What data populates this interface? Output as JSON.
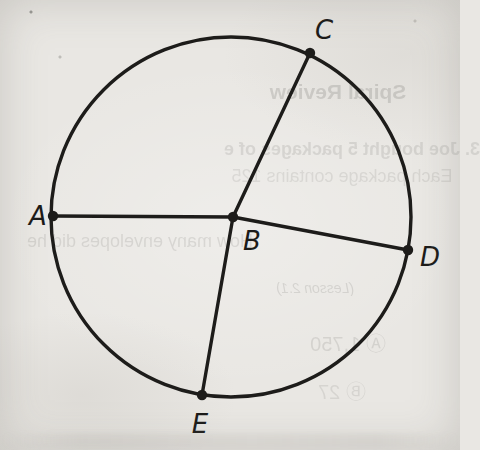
{
  "figure": {
    "type": "circle-with-radii",
    "circle": {
      "cx": 231,
      "cy": 217,
      "r": 180
    },
    "stroke_color": "#1d1c1a",
    "stroke_width": 3.4,
    "dot_radius": 5.2,
    "center_point": "B",
    "points": {
      "A": {
        "x": 53,
        "y": 216,
        "lx": 38,
        "ly": 216
      },
      "B": {
        "x": 233,
        "y": 217,
        "lx": 252,
        "ly": 241
      },
      "C": {
        "x": 310,
        "y": 53,
        "lx": 324,
        "ly": 30
      },
      "D": {
        "x": 408,
        "y": 250,
        "lx": 430,
        "ly": 257
      },
      "E": {
        "x": 202,
        "y": 395,
        "lx": 200,
        "ly": 424
      }
    },
    "segments": [
      [
        "A",
        "B"
      ],
      [
        "B",
        "C"
      ],
      [
        "B",
        "D"
      ],
      [
        "B",
        "E"
      ]
    ]
  },
  "bleed_through_text": {
    "color": "#5f5e5a",
    "lines": [
      {
        "text": "Spiral Review",
        "cx": 338,
        "cy": 92,
        "size": 21,
        "weight": "bold",
        "style": "normal",
        "opacity": 0.2
      },
      {
        "text": "3. Joe bought 5 packages of e",
        "cx": 352,
        "cy": 149,
        "size": 18,
        "weight": "bold",
        "style": "normal",
        "opacity": 0.15
      },
      {
        "text": "Each package contains 125",
        "cx": 342,
        "cy": 176,
        "size": 18,
        "weight": "normal",
        "style": "normal",
        "opacity": 0.13
      },
      {
        "text": "How many envelopes did he",
        "cx": 140,
        "cy": 241,
        "size": 18,
        "weight": "normal",
        "style": "normal",
        "opacity": 0.15
      },
      {
        "text": "(Lesson 2.1)",
        "cx": 315,
        "cy": 288,
        "size": 14,
        "weight": "normal",
        "style": "italic",
        "opacity": 0.16
      },
      {
        "text": "Ⓐ 1,750",
        "cx": 348,
        "cy": 342,
        "size": 20,
        "weight": "normal",
        "style": "normal",
        "opacity": 0.15
      },
      {
        "text": "Ⓑ 27",
        "cx": 342,
        "cy": 390,
        "size": 20,
        "weight": "normal",
        "style": "normal",
        "opacity": 0.13
      }
    ]
  },
  "colors": {
    "paper": "#e9e7e3",
    "ink": "#1d1c1a"
  }
}
